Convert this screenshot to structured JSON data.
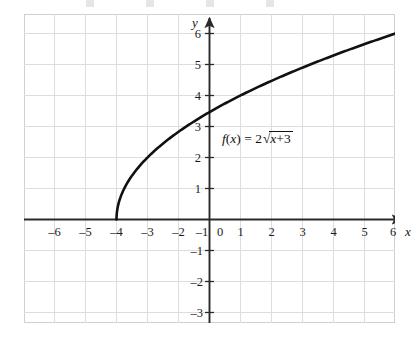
{
  "chart_data": {
    "type": "line",
    "title": "",
    "xlabel": "x",
    "ylabel": "y",
    "function_label": "f(x) = 2√(x + 3)",
    "function_parts": {
      "name": "f",
      "arg_open": "(",
      "arg": "x",
      "arg_close": ")",
      "equals": "=",
      "coefficient": "2",
      "radical": "√",
      "radicand_var": "x",
      "radicand_op": "+",
      "radicand_const": "3"
    },
    "xlim": [
      -7,
      7
    ],
    "ylim": [
      -3.5,
      6.8
    ],
    "x_ticks": [
      -6,
      -5,
      -4,
      -3,
      -2,
      -1,
      0,
      1,
      2,
      3,
      4,
      5,
      6
    ],
    "y_ticks": [
      -3,
      -2,
      -1,
      1,
      2,
      3,
      4,
      5,
      6
    ],
    "x_tick_labels": [
      "–6",
      "–5",
      "–4",
      "–3",
      "–2",
      "–1",
      "0",
      "1",
      "2",
      "3",
      "4",
      "5",
      "6"
    ],
    "y_tick_labels_positive": [
      "1",
      "2",
      "3",
      "4",
      "5",
      "6"
    ],
    "y_tick_labels_negative": [
      "–1",
      "–2",
      "–3"
    ],
    "origin_label": "0",
    "grid": true,
    "legend": "none",
    "domain_start": -3,
    "domain_end": 6.4,
    "y_intercept": 3.464,
    "x_intercept": -3,
    "series": [
      {
        "name": "f(x) = 2√(x + 3)",
        "color": "#111111",
        "points": [
          [
            -3,
            0
          ],
          [
            -2.9,
            0.632
          ],
          [
            -2.8,
            0.894
          ],
          [
            -2.7,
            1.095
          ],
          [
            -2.6,
            1.265
          ],
          [
            -2.5,
            1.414
          ],
          [
            -2.4,
            1.549
          ],
          [
            -2.2,
            1.789
          ],
          [
            -2,
            2
          ],
          [
            -1.75,
            2.236
          ],
          [
            -1.5,
            2.449
          ],
          [
            -1.25,
            2.646
          ],
          [
            -1,
            2.828
          ],
          [
            -0.5,
            3.162
          ],
          [
            0,
            3.464
          ],
          [
            0.5,
            3.742
          ],
          [
            1,
            4
          ],
          [
            1.5,
            4.243
          ],
          [
            2,
            4.472
          ],
          [
            2.5,
            4.69
          ],
          [
            3,
            4.899
          ],
          [
            3.5,
            5.099
          ],
          [
            4,
            5.292
          ],
          [
            4.5,
            5.477
          ],
          [
            5,
            5.657
          ],
          [
            5.5,
            5.831
          ],
          [
            6,
            6
          ],
          [
            6.4,
            6.13
          ]
        ]
      }
    ]
  },
  "axes": {
    "x_axis_name": "x",
    "y_axis_name": "y"
  },
  "colors": {
    "curve": "#111111",
    "axis": "#2a2a2a",
    "grid": "#d9dade",
    "grid_border": "#cfd0d4",
    "text": "#1c1c1c",
    "background": "#ffffff"
  }
}
